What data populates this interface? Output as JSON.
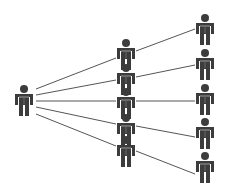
{
  "diagram": {
    "type": "tree-fanout",
    "colors": {
      "figure": "#3c3c3c",
      "figure_highlight": "#8a8a8a",
      "line": "#555555",
      "background": "#ffffff"
    },
    "nodes": [
      {
        "id": "root",
        "x": 24,
        "y": 101,
        "icon": "person-icon"
      },
      {
        "id": "m1",
        "x": 126,
        "y": 55,
        "icon": "person-icon"
      },
      {
        "id": "m2",
        "x": 126,
        "y": 80,
        "icon": "person-icon"
      },
      {
        "id": "m3",
        "x": 126,
        "y": 104,
        "icon": "person-icon"
      },
      {
        "id": "m4",
        "x": 126,
        "y": 130,
        "icon": "person-icon"
      },
      {
        "id": "m5",
        "x": 126,
        "y": 152,
        "icon": "person-icon"
      },
      {
        "id": "r1",
        "x": 205,
        "y": 30,
        "icon": "person-icon"
      },
      {
        "id": "r2",
        "x": 205,
        "y": 65,
        "icon": "person-icon"
      },
      {
        "id": "r3",
        "x": 205,
        "y": 100,
        "icon": "person-icon"
      },
      {
        "id": "r4",
        "x": 205,
        "y": 134,
        "icon": "person-icon"
      },
      {
        "id": "r5",
        "x": 205,
        "y": 168,
        "icon": "person-icon"
      }
    ],
    "edges": [
      {
        "from": [
          36,
          89
        ],
        "to": [
          116,
          58
        ]
      },
      {
        "from": [
          36,
          95
        ],
        "to": [
          116,
          80
        ]
      },
      {
        "from": [
          36,
          101
        ],
        "to": [
          116,
          101
        ]
      },
      {
        "from": [
          36,
          107
        ],
        "to": [
          116,
          124
        ]
      },
      {
        "from": [
          36,
          114
        ],
        "to": [
          116,
          146
        ]
      },
      {
        "from": [
          136,
          51
        ],
        "to": [
          195,
          29
        ]
      },
      {
        "from": [
          136,
          77
        ],
        "to": [
          195,
          65
        ]
      },
      {
        "from": [
          136,
          101
        ],
        "to": [
          195,
          101
        ]
      },
      {
        "from": [
          136,
          126
        ],
        "to": [
          195,
          137
        ]
      },
      {
        "from": [
          136,
          151
        ],
        "to": [
          195,
          174
        ]
      }
    ]
  }
}
